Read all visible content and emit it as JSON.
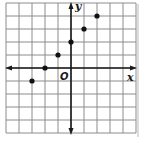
{
  "chart_data": {
    "type": "scatter",
    "title": "",
    "xlabel": "x",
    "ylabel": "y",
    "origin_label": "O",
    "grid": true,
    "xlim": [
      -5,
      5
    ],
    "ylim": [
      -5,
      5
    ],
    "tick_labels": false,
    "series": [
      {
        "name": "points",
        "points": [
          {
            "x": -3,
            "y": -1
          },
          {
            "x": -2,
            "y": 0
          },
          {
            "x": -1,
            "y": 1
          },
          {
            "x": 0,
            "y": 2
          },
          {
            "x": 1,
            "y": 3
          },
          {
            "x": 2,
            "y": 4
          }
        ]
      }
    ]
  },
  "labels": {
    "x_axis": "x",
    "y_axis": "y",
    "origin": "O"
  },
  "colors": {
    "grid": "#8c8c8c",
    "axis": "#1a1a1a",
    "point": "#111111",
    "border_shadow": "#d0d0d0"
  }
}
